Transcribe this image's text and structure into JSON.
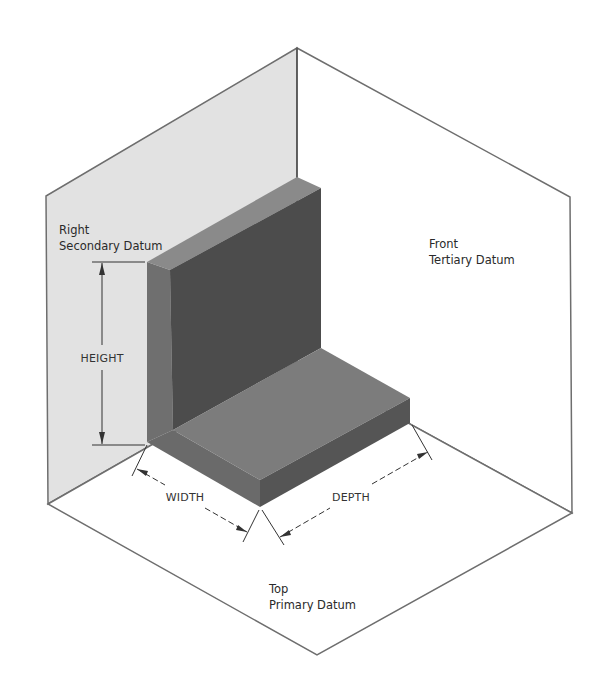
{
  "planes": {
    "right": {
      "line1": "Right",
      "line2": "Secondary Datum",
      "fill": "#e2e2e2"
    },
    "front": {
      "line1": "Front",
      "line2": "Tertiary Datum",
      "fill": "#ffffff"
    },
    "top": {
      "line1": "Top",
      "line2": "Primary Datum",
      "fill": "#ffffff"
    }
  },
  "dimensions": {
    "height": "HEIGHT",
    "width": "WIDTH",
    "depth": "DEPTH"
  },
  "colors": {
    "outline": "#6e6e6e",
    "wall_top": "#8a8a8a",
    "wall_side": "#6f6f6f",
    "wall_front": "#4c4c4c",
    "floor_top": "#7c7c7c",
    "floor_front_left": "#6a6a6a",
    "floor_front_right": "#555555",
    "dim_line": "#333333"
  }
}
